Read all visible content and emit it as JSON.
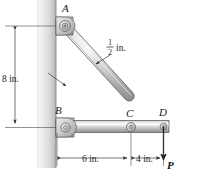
{
  "figure": {
    "background_color": "#ffffff"
  },
  "labels": {
    "point_a": "A",
    "point_b": "B",
    "point_c": "C",
    "point_d": "D",
    "force": "P"
  },
  "dimensions": {
    "vertical": {
      "text": "8 in.",
      "value": 8,
      "unit": "in."
    },
    "horizontal_left": {
      "text": "6 in.",
      "value": 6,
      "unit": "in."
    },
    "horizontal_right": {
      "text": "4 in.",
      "value": 4,
      "unit": "in."
    },
    "thickness": {
      "numerator": "1",
      "denominator": "2",
      "unit": "in."
    }
  },
  "colors": {
    "wall_light": "#f2f2f2",
    "wall_mid": "#d8d8d8",
    "wall_dark": "#b9b9b9",
    "metal_light": "#f4f4f4",
    "metal_mid": "#cfcfcf",
    "metal_dark": "#9a9a9a",
    "outline": "#555555",
    "ink": "#1a1a1a"
  }
}
